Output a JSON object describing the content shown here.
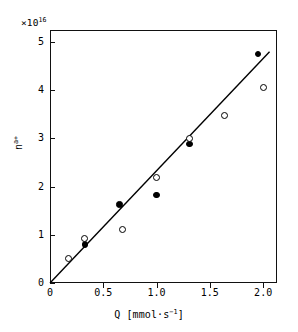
{
  "chart_data": {
    "type": "scatter",
    "title": "",
    "xlabel": "Q [mmol·s⁻¹]",
    "ylabel": "n",
    "ylabel_sup": "a+",
    "y_multiplier": "×10",
    "y_multiplier_exp": "16",
    "xlim": [
      0,
      2.13
    ],
    "ylim": [
      0,
      5.25
    ],
    "grid": false,
    "legend": "none",
    "xticks": [
      0,
      0.5,
      1.0,
      1.5,
      2.0
    ],
    "xticklabels": [
      "0",
      "0.5",
      "1.0",
      "1.5",
      "2.0"
    ],
    "yticks": [
      0,
      1,
      2,
      3,
      4,
      5
    ],
    "yticklabels": [
      "0",
      "1",
      "2",
      "3",
      "4",
      "5"
    ],
    "series": [
      {
        "name": "filled-circles",
        "marker": "filled-circle",
        "color": "#000000",
        "points": [
          {
            "x": 0.33,
            "y": 0.8
          },
          {
            "x": 0.65,
            "y": 1.63
          },
          {
            "x": 1.0,
            "y": 1.83
          },
          {
            "x": 1.31,
            "y": 2.88
          },
          {
            "x": 1.95,
            "y": 4.75
          }
        ]
      },
      {
        "name": "open-circles",
        "marker": "open-circle",
        "color": "#000000",
        "points": [
          {
            "x": 0.17,
            "y": 0.5
          },
          {
            "x": 0.32,
            "y": 0.92
          },
          {
            "x": 0.68,
            "y": 1.12
          },
          {
            "x": 1.0,
            "y": 2.18
          },
          {
            "x": 1.31,
            "y": 3.0
          },
          {
            "x": 1.64,
            "y": 3.48
          },
          {
            "x": 2.0,
            "y": 4.05
          }
        ]
      }
    ],
    "fit_line": {
      "name": "linear-fit",
      "x0": 0.0,
      "y0": 0.0,
      "x1": 2.06,
      "y1": 4.8,
      "slope": 2.33,
      "intercept": 0.0,
      "color": "#000000"
    }
  }
}
